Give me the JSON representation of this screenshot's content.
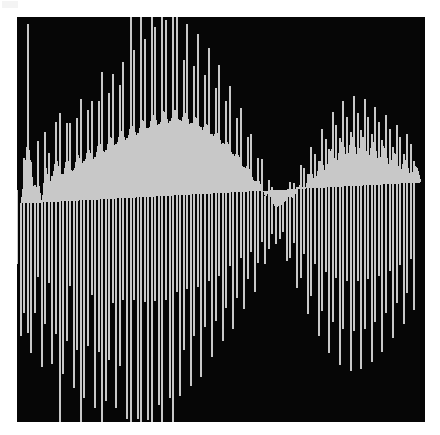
{
  "figure": {
    "title": "",
    "background_color": "#ffffff",
    "plot_background_color": "#060606",
    "trace_color": "#c8c8c8",
    "plot_left_px": 17,
    "plot_top_px": 17,
    "plot_width_px": 408,
    "plot_height_px": 405
  },
  "chart_data": {
    "type": "line",
    "render_style": "impulse-stem-vertical-lines",
    "title": "",
    "subtitle": "",
    "xlabel": "",
    "ylabel": "",
    "xticks": [],
    "yticks": [],
    "xticklabels": [],
    "yticklabels": [],
    "grid": false,
    "legend": null,
    "legend_position": "none",
    "xlim": [
      0,
      115
    ],
    "ylim": [
      -1.18,
      1.18
    ],
    "baseline": 0,
    "series": [
      {
        "name": "waveform",
        "color": "#c8c8c8",
        "stem_width_px": 2,
        "stem_spacing_px": 3.54,
        "x": [
          0,
          1,
          2,
          3,
          4,
          5,
          6,
          7,
          8,
          9,
          10,
          11,
          12,
          13,
          14,
          15,
          16,
          17,
          18,
          19,
          20,
          21,
          22,
          23,
          24,
          25,
          26,
          27,
          28,
          29,
          30,
          31,
          32,
          33,
          34,
          35,
          36,
          37,
          38,
          39,
          40,
          41,
          42,
          43,
          44,
          45,
          46,
          47,
          48,
          49,
          50,
          51,
          52,
          53,
          54,
          55,
          56,
          57,
          58,
          59,
          60,
          61,
          62,
          63,
          64,
          65,
          66,
          67,
          68,
          69,
          70,
          71,
          72,
          73,
          74,
          75,
          76,
          77,
          78,
          79,
          80,
          81,
          82,
          83,
          84,
          85,
          86,
          87,
          88,
          89,
          90,
          91,
          92,
          93,
          94,
          95,
          96,
          97,
          98,
          99,
          100,
          101,
          102,
          103,
          104,
          105,
          106,
          107,
          108,
          109,
          110,
          111,
          112,
          113,
          114
        ],
        "y_upper": [
          0.17,
          0.17,
          0.45,
          0.93,
          0.58,
          0.25,
          0.46,
          0.18,
          0.64,
          0.39,
          0.44,
          0.71,
          0.52,
          0.46,
          0.7,
          0.56,
          0.5,
          0.74,
          0.62,
          0.59,
          0.8,
          0.69,
          0.63,
          0.86,
          0.77,
          0.7,
          0.92,
          0.85,
          0.76,
          0.98,
          0.92,
          0.82,
          1.04,
          0.99,
          0.87,
          1.09,
          1.05,
          0.92,
          1.14,
          1.12,
          0.96,
          1.17,
          1.16,
          0.99,
          1.18,
          1.18,
          1.0,
          1.16,
          1.14,
          0.97,
          1.12,
          1.08,
          0.93,
          1.05,
          1.0,
          0.86,
          0.96,
          0.9,
          0.77,
          0.86,
          0.78,
          0.66,
          0.74,
          0.65,
          0.53,
          0.6,
          0.5,
          0.39,
          0.45,
          0.35,
          0.24,
          0.29,
          0.19,
          0.12,
          0.15,
          0.17,
          0.22,
          0.27,
          0.21,
          0.33,
          0.4,
          0.3,
          0.46,
          0.53,
          0.38,
          0.59,
          0.66,
          0.47,
          0.71,
          0.78,
          0.55,
          0.82,
          0.86,
          0.6,
          0.88,
          0.9,
          0.62,
          0.9,
          0.88,
          0.6,
          0.86,
          0.82,
          0.57,
          0.8,
          0.76,
          0.53,
          0.73,
          0.69,
          0.48,
          0.66,
          0.62,
          0.44,
          0.59,
          0.55,
          0.4
        ],
        "y_lower": [
          -0.62,
          -0.68,
          -0.74,
          -0.71,
          -0.78,
          -0.74,
          -0.8,
          -0.86,
          -0.82,
          -0.88,
          -0.84,
          -0.9,
          -0.95,
          -0.9,
          -0.96,
          -0.92,
          -0.98,
          -1.03,
          -0.98,
          -1.04,
          -1.0,
          -1.05,
          -1.1,
          -1.04,
          -1.1,
          -1.06,
          -1.11,
          -1.16,
          -1.1,
          -1.15,
          -1.11,
          -1.16,
          -1.18,
          -1.12,
          -1.16,
          -1.11,
          -1.15,
          -1.17,
          -1.1,
          -1.13,
          -1.08,
          -1.11,
          -1.12,
          -1.04,
          -1.06,
          -1.01,
          -1.03,
          -1.03,
          -0.96,
          -0.97,
          -0.92,
          -0.93,
          -0.92,
          -0.85,
          -0.85,
          -0.8,
          -0.8,
          -0.78,
          -0.71,
          -0.7,
          -0.65,
          -0.64,
          -0.62,
          -0.54,
          -0.52,
          -0.47,
          -0.45,
          -0.42,
          -0.34,
          -0.31,
          -0.26,
          -0.23,
          -0.2,
          -0.14,
          -0.15,
          -0.18,
          -0.24,
          -0.3,
          -0.33,
          -0.4,
          -0.46,
          -0.48,
          -0.55,
          -0.6,
          -0.62,
          -0.68,
          -0.72,
          -0.73,
          -0.78,
          -0.81,
          -0.81,
          -0.85,
          -0.86,
          -0.85,
          -0.88,
          -0.88,
          -0.86,
          -0.87,
          -0.86,
          -0.83,
          -0.83,
          -0.81,
          -0.78,
          -0.77,
          -0.74,
          -0.71,
          -0.69,
          -0.66,
          -0.63,
          -0.61,
          -0.58,
          -0.55,
          -0.53
        ]
      }
    ],
    "annotations": []
  }
}
